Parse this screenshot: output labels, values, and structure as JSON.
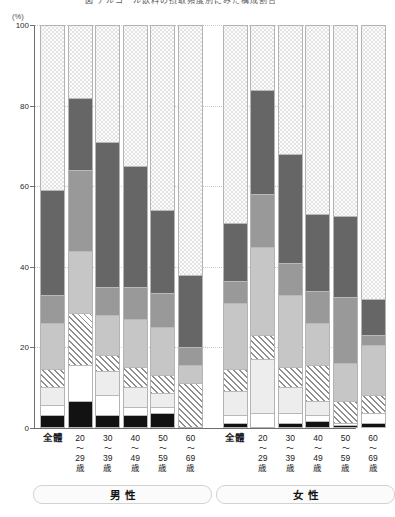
{
  "chart_title": "図 アルコール飲料の摂取頻度別にみた構成割合",
  "axis": {
    "unit_label": "(%)",
    "y_ticks": [
      0,
      20,
      40,
      60,
      80,
      100
    ],
    "y_max": 100,
    "y_min": 0
  },
  "groups": [
    {
      "label": "男性"
    },
    {
      "label": "女性"
    }
  ],
  "categories": [
    {
      "l1": "全體",
      "l2": "",
      "l3": "",
      "l4": ""
    },
    {
      "l1": "20",
      "l2": "〜",
      "l3": "29",
      "l4": "歳"
    },
    {
      "l1": "30",
      "l2": "〜",
      "l3": "39",
      "l4": "歳"
    },
    {
      "l1": "40",
      "l2": "〜",
      "l3": "49",
      "l4": "歳"
    },
    {
      "l1": "50",
      "l2": "〜",
      "l3": "59",
      "l4": "歳"
    },
    {
      "l1": "60",
      "l2": "〜",
      "l3": "69",
      "l4": "歳"
    }
  ],
  "legend_keys": [
    {
      "key": "black",
      "label": "黒（最下層）",
      "color": "#121212"
    },
    {
      "key": "white",
      "label": "白",
      "color": "#ffffff"
    },
    {
      "key": "pale",
      "label": "淡灰",
      "color": "#ededed"
    },
    {
      "key": "hatch",
      "label": "斜線",
      "color": "#8e8e8e"
    },
    {
      "key": "light",
      "label": "薄灰",
      "color": "#c6c6c6"
    },
    {
      "key": "mid",
      "label": "中灰",
      "color": "#999999"
    },
    {
      "key": "dark",
      "label": "濃灰",
      "color": "#666666"
    },
    {
      "key": "dotted",
      "label": "点模様",
      "color": "#e3e3e3"
    }
  ],
  "chart_data": {
    "type": "bar",
    "title": "図 アルコール飲料の摂取頻度別にみた構成割合",
    "subtitle": "",
    "xlabel": "",
    "ylabel": "(%)",
    "ylim": [
      0,
      100
    ],
    "stacked": true,
    "percent_stacked": true,
    "grid": true,
    "legend_position": "none",
    "categories": [
      "男性 全體",
      "男性 20〜29歳",
      "男性 30〜39歳",
      "男性 40〜49歳",
      "男性 50〜59歳",
      "男性 60〜69歳",
      "女性 全體",
      "女性 20〜29歳",
      "女性 30〜39歳",
      "女性 40〜49歳",
      "女性 50〜59歳",
      "女性 60〜69歳"
    ],
    "series": [
      {
        "name": "black",
        "values": [
          3.0,
          6.5,
          3.0,
          3.0,
          3.5,
          0.0,
          1.0,
          0.0,
          1.0,
          1.5,
          0.5,
          1.0
        ]
      },
      {
        "name": "white",
        "values": [
          2.5,
          9.0,
          5.0,
          2.0,
          1.5,
          0.0,
          2.0,
          3.5,
          2.5,
          1.5,
          0.5,
          2.5
        ]
      },
      {
        "name": "pale",
        "values": [
          4.5,
          0.0,
          6.0,
          5.0,
          3.5,
          0.0,
          6.0,
          13.5,
          6.5,
          3.5,
          0.0,
          0.0
        ]
      },
      {
        "name": "hatch",
        "values": [
          4.5,
          13.0,
          4.0,
          5.0,
          4.5,
          11.0,
          5.5,
          6.0,
          5.0,
          9.0,
          5.5,
          4.5
        ]
      },
      {
        "name": "light",
        "values": [
          11.5,
          15.5,
          10.0,
          12.0,
          12.0,
          4.5,
          16.5,
          22.0,
          18.0,
          10.5,
          9.5,
          12.5
        ]
      },
      {
        "name": "mid",
        "values": [
          7.0,
          20.0,
          7.0,
          8.0,
          8.5,
          4.5,
          5.5,
          13.0,
          8.0,
          8.0,
          16.5,
          2.5
        ]
      },
      {
        "name": "dark",
        "values": [
          26.0,
          18.0,
          36.0,
          30.0,
          20.5,
          18.0,
          14.5,
          26.0,
          27.0,
          19.0,
          20.0,
          9.0
        ]
      },
      {
        "name": "dotted",
        "values": [
          41.0,
          18.0,
          29.0,
          35.0,
          46.0,
          62.0,
          49.0,
          16.0,
          32.0,
          47.0,
          47.5,
          68.0
        ]
      }
    ]
  }
}
